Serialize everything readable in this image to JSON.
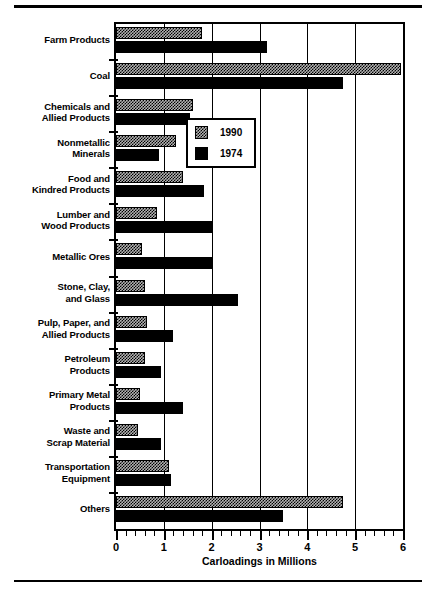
{
  "chart_data": {
    "type": "bar",
    "orientation": "horizontal",
    "title": "",
    "xlabel": "Carloadings in Millions",
    "ylabel": "",
    "xlim": [
      0,
      6
    ],
    "xticks": [
      0,
      1,
      2,
      3,
      4,
      5,
      6
    ],
    "xtick_labels": [
      "0",
      "1",
      "2",
      "3",
      "4",
      "5",
      "6"
    ],
    "minor_tick_step": 0.2,
    "grid": "vertical",
    "legend_position": "center-right",
    "categories": [
      "Farm Products",
      "Coal",
      "Chemicals and Allied Products",
      "Nonmetallic Minerals",
      "Food and Kindred Products",
      "Lumber and Wood Products",
      "Metallic Ores",
      "Stone, Clay, and Glass",
      "Pulp, Paper, and Allied Products",
      "Petroleum Products",
      "Primary Metal Products",
      "Waste and Scrap Material",
      "Transportation Equipment",
      "Others"
    ],
    "category_label_lines": [
      [
        "Farm Products"
      ],
      [
        "Coal"
      ],
      [
        "Chemicals and",
        "Allied Products"
      ],
      [
        "Nonmetallic",
        "Minerals"
      ],
      [
        "Food and",
        "Kindred Products"
      ],
      [
        "Lumber and",
        "Wood Products"
      ],
      [
        "Metallic Ores"
      ],
      [
        "Stone, Clay,",
        "and Glass"
      ],
      [
        "Pulp, Paper, and",
        "Allied Products"
      ],
      [
        "Petroleum",
        "Products"
      ],
      [
        "Primary Metal",
        "Products"
      ],
      [
        "Waste and",
        "Scrap Material"
      ],
      [
        "Transportation",
        "Equipment"
      ],
      [
        "Others"
      ]
    ],
    "series": [
      {
        "name": "1990",
        "color": "#b3b3b3",
        "pattern": "checker-hatch",
        "values": [
          1.8,
          5.95,
          1.6,
          1.25,
          1.4,
          0.85,
          0.55,
          0.6,
          0.65,
          0.6,
          0.5,
          0.45,
          1.1,
          4.75
        ]
      },
      {
        "name": "1974",
        "color": "#000000",
        "pattern": "solid",
        "values": [
          3.15,
          4.75,
          1.55,
          0.9,
          1.85,
          2.0,
          2.0,
          2.55,
          1.2,
          0.95,
          1.4,
          0.95,
          1.15,
          3.5
        ]
      }
    ]
  },
  "legend": {
    "entries": [
      {
        "label": "1990"
      },
      {
        "label": "1974"
      }
    ]
  }
}
